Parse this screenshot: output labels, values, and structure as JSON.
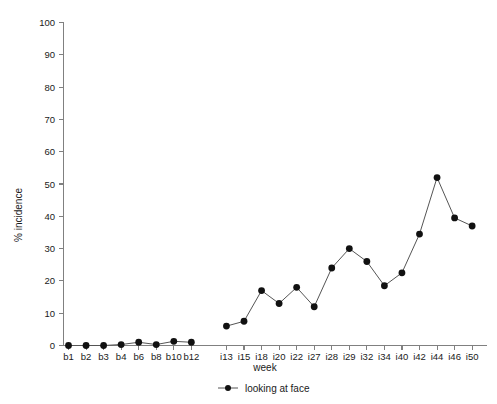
{
  "chart_data": {
    "type": "line",
    "title": "",
    "subtitle": "",
    "xlabel": "week",
    "ylabel": "% incidence",
    "ylim": [
      0,
      100
    ],
    "ytick_step": 10,
    "yticks": [
      0,
      10,
      20,
      30,
      40,
      50,
      60,
      70,
      80,
      90,
      100
    ],
    "ytick_labels": [
      "0",
      "10",
      "20",
      "30",
      "40",
      "50",
      "60",
      "70",
      "80",
      "90",
      "100"
    ],
    "grid": false,
    "legend_position": "bottom-center",
    "legend": [
      "looking at face"
    ],
    "categories": [
      "b1",
      "b2",
      "b3",
      "b4",
      "b6",
      "b8",
      "b10",
      "b12",
      "i13",
      "i15",
      "i18",
      "i20",
      "i22",
      "i27",
      "i28",
      "i29",
      "i32",
      "i34",
      "i40",
      "i42",
      "i44",
      "i46",
      "i50"
    ],
    "gap_after_category": "b12",
    "series": [
      {
        "name": "looking at face",
        "color": "#111111",
        "line_color": "#555555",
        "marker": "circle-filled",
        "values": [
          0,
          0,
          0,
          0.3,
          1.0,
          0.3,
          1.3,
          1.0,
          6,
          7.5,
          17,
          13,
          18,
          12,
          24,
          30,
          26,
          18.5,
          22.5,
          34.5,
          52,
          39.5,
          37
        ],
        "segments": [
          {
            "from": "b1",
            "to": "b12"
          },
          {
            "from": "i13",
            "to": "i50"
          }
        ]
      }
    ]
  },
  "axes": {
    "y_axis_name": "y-axis",
    "x_axis_name": "x-axis"
  },
  "legend": {
    "entries": [
      {
        "label": "looking at face",
        "marker": "circle-filled",
        "color": "#111111"
      }
    ]
  }
}
